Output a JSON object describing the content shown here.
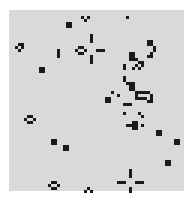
{
  "game": {
    "name": "Game of Life board",
    "cell_size_px": 3,
    "origin_px": [
      9,
      10
    ],
    "cols": 58,
    "rows": 60,
    "colors": {
      "background": "#d9d9d9",
      "live_cell": "#1a1a1a",
      "page": "#ffffff"
    },
    "live_cells": [
      [
        24,
        2
      ],
      [
        26,
        2
      ],
      [
        25,
        3
      ],
      [
        39,
        2
      ],
      [
        19,
        4
      ],
      [
        20,
        4
      ],
      [
        19,
        5
      ],
      [
        20,
        5
      ],
      [
        3,
        11
      ],
      [
        4,
        11
      ],
      [
        2,
        12
      ],
      [
        4,
        12
      ],
      [
        3,
        13
      ],
      [
        16,
        13
      ],
      [
        16,
        14
      ],
      [
        16,
        15
      ],
      [
        23,
        12
      ],
      [
        24,
        12
      ],
      [
        22,
        13
      ],
      [
        25,
        13
      ],
      [
        23,
        14
      ],
      [
        24,
        14
      ],
      [
        27,
        8
      ],
      [
        27,
        9
      ],
      [
        27,
        10
      ],
      [
        29,
        13
      ],
      [
        30,
        13
      ],
      [
        31,
        13
      ],
      [
        27,
        15
      ],
      [
        27,
        16
      ],
      [
        27,
        17
      ],
      [
        10,
        19
      ],
      [
        11,
        19
      ],
      [
        10,
        20
      ],
      [
        11,
        20
      ],
      [
        46,
        10
      ],
      [
        47,
        10
      ],
      [
        46,
        11
      ],
      [
        47,
        11
      ],
      [
        48,
        12
      ],
      [
        48,
        13
      ],
      [
        47,
        14
      ],
      [
        46,
        15
      ],
      [
        47,
        15
      ],
      [
        40,
        14
      ],
      [
        41,
        14
      ],
      [
        40,
        15
      ],
      [
        41,
        15
      ],
      [
        40,
        16
      ],
      [
        41,
        16
      ],
      [
        42,
        16
      ],
      [
        43,
        17
      ],
      [
        44,
        17
      ],
      [
        42,
        18
      ],
      [
        44,
        18
      ],
      [
        41,
        19
      ],
      [
        43,
        19
      ],
      [
        38,
        18
      ],
      [
        38,
        19
      ],
      [
        38,
        22
      ],
      [
        38,
        23
      ],
      [
        39,
        24
      ],
      [
        40,
        24
      ],
      [
        41,
        24
      ],
      [
        40,
        25
      ],
      [
        41,
        25
      ],
      [
        40,
        26
      ],
      [
        41,
        26
      ],
      [
        34,
        27
      ],
      [
        36,
        28
      ],
      [
        32,
        29
      ],
      [
        33,
        29
      ],
      [
        32,
        30
      ],
      [
        33,
        30
      ],
      [
        42,
        27
      ],
      [
        43,
        27
      ],
      [
        44,
        27
      ],
      [
        45,
        27
      ],
      [
        46,
        27
      ],
      [
        42,
        28
      ],
      [
        47,
        28
      ],
      [
        42,
        29
      ],
      [
        43,
        29
      ],
      [
        44,
        29
      ],
      [
        45,
        29
      ],
      [
        47,
        29
      ],
      [
        46,
        30
      ],
      [
        47,
        30
      ],
      [
        38,
        31
      ],
      [
        39,
        31
      ],
      [
        40,
        31
      ],
      [
        38,
        34
      ],
      [
        43,
        34
      ],
      [
        44,
        35
      ],
      [
        41,
        37
      ],
      [
        42,
        37
      ],
      [
        39,
        38
      ],
      [
        40,
        38
      ],
      [
        41,
        38
      ],
      [
        42,
        38
      ],
      [
        41,
        39
      ],
      [
        42,
        39
      ],
      [
        44,
        38
      ],
      [
        49,
        40
      ],
      [
        50,
        40
      ],
      [
        49,
        41
      ],
      [
        50,
        41
      ],
      [
        6,
        35
      ],
      [
        7,
        35
      ],
      [
        5,
        36
      ],
      [
        8,
        36
      ],
      [
        6,
        37
      ],
      [
        7,
        37
      ],
      [
        14,
        43
      ],
      [
        15,
        43
      ],
      [
        14,
        44
      ],
      [
        15,
        44
      ],
      [
        18,
        45
      ],
      [
        19,
        45
      ],
      [
        18,
        46
      ],
      [
        19,
        46
      ],
      [
        55,
        43
      ],
      [
        56,
        43
      ],
      [
        55,
        44
      ],
      [
        56,
        44
      ],
      [
        52,
        50
      ],
      [
        53,
        50
      ],
      [
        52,
        51
      ],
      [
        53,
        51
      ],
      [
        40,
        53
      ],
      [
        40,
        54
      ],
      [
        40,
        55
      ],
      [
        36,
        57
      ],
      [
        37,
        57
      ],
      [
        38,
        57
      ],
      [
        42,
        57
      ],
      [
        43,
        57
      ],
      [
        44,
        57
      ],
      [
        40,
        59
      ],
      [
        40,
        60
      ],
      [
        14,
        57
      ],
      [
        15,
        57
      ],
      [
        13,
        58
      ],
      [
        16,
        58
      ],
      [
        14,
        59
      ],
      [
        15,
        59
      ],
      [
        26,
        59
      ],
      [
        25,
        60
      ],
      [
        27,
        60
      ]
    ]
  }
}
